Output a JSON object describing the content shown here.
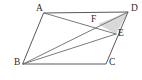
{
  "figure": {
    "kind": "geometry-diagram",
    "shape": "parallelogram",
    "background_color": "#ffffff",
    "stroke_color": "#595959",
    "cevian_color": "#6b6b6b",
    "shaded_fill_color": "#d8d8d8",
    "label_color": "#2b2b2b",
    "points": {
      "A": {
        "label": "A",
        "x": 44,
        "y": 13,
        "label_x": 36,
        "label_y": 9
      },
      "B": {
        "label": "B",
        "x": 23,
        "y": 64,
        "label_x": 14,
        "label_y": 63
      },
      "C": {
        "label": "C",
        "x": 106,
        "y": 64,
        "label_x": 109,
        "label_y": 63
      },
      "D": {
        "label": "D",
        "x": 128,
        "y": 12,
        "label_x": 131,
        "label_y": 9
      },
      "E": {
        "label": "E",
        "x": 116,
        "y": 34,
        "label_x": 118,
        "label_y": 34
      },
      "F": {
        "label": "F",
        "x": 98,
        "y": 24,
        "label_x": 91,
        "label_y": 20
      }
    },
    "outline_path": "A,D,C,B",
    "segments": [
      {
        "name": "side-AD",
        "from": "A",
        "to": "D",
        "kind": "edge"
      },
      {
        "name": "side-DC",
        "from": "D",
        "to": "C",
        "kind": "edge"
      },
      {
        "name": "side-CB",
        "from": "C",
        "to": "B",
        "kind": "edge"
      },
      {
        "name": "side-BA",
        "from": "B",
        "to": "A",
        "kind": "edge"
      },
      {
        "name": "diagonal-BD",
        "from": "B",
        "to": "D",
        "kind": "cevian"
      },
      {
        "name": "segment-AE",
        "from": "A",
        "to": "E",
        "kind": "cevian"
      },
      {
        "name": "segment-BE",
        "from": "B",
        "to": "E",
        "kind": "cevian"
      }
    ],
    "shaded_region": {
      "name": "triangle-FDE",
      "vertices": [
        "F",
        "D",
        "E"
      ]
    },
    "labels": [
      "A",
      "B",
      "C",
      "D",
      "E",
      "F"
    ]
  }
}
